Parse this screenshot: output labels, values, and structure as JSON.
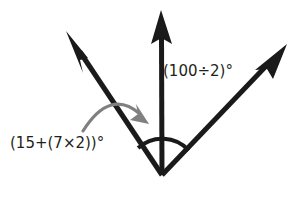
{
  "diagram": {
    "type": "angle-diagram",
    "background_color": "#ffffff",
    "ray_color": "#1a1a1a",
    "arc_color": "#1a1a1a",
    "curved_arrow_color": "#808080",
    "text_color": "#231f20",
    "vertex": {
      "x": 162,
      "y": 175,
      "name": "common-vertex"
    },
    "rays": [
      {
        "name": "left-ray",
        "from": {
          "x": 162,
          "y": 175
        },
        "to": {
          "x": 66,
          "y": 31
        },
        "has_arrowhead": true,
        "stroke_width": 5
      },
      {
        "name": "vertical-ray",
        "from": {
          "x": 162,
          "y": 175
        },
        "to": {
          "x": 161,
          "y": 10
        },
        "has_arrowhead": true,
        "stroke_width": 5
      },
      {
        "name": "right-ray",
        "from": {
          "x": 162,
          "y": 175
        },
        "to": {
          "x": 287,
          "y": 44
        },
        "has_arrowhead": true,
        "stroke_width": 5
      }
    ],
    "arc": {
      "name": "angle-arc",
      "center": {
        "x": 162,
        "y": 175
      },
      "radius": 36,
      "stroke_width": 4,
      "spans_from_ray": "left-ray",
      "spans_to_ray": "right-ray"
    },
    "curved_arrow": {
      "name": "rotation-arrow",
      "start": {
        "x": 83,
        "y": 131
      },
      "end": {
        "x": 147,
        "y": 123
      },
      "control": {
        "x": 112,
        "y": 91
      },
      "stroke_width": 3,
      "direction": "clockwise"
    },
    "labels": [
      {
        "name": "left-angle-label",
        "text": "(15+(7×2))°",
        "expression": "(15+(7×2))",
        "value_degrees": 29,
        "position": {
          "x": 10,
          "y": 136
        },
        "describes_ray_pair": [
          "left-ray",
          "vertical-ray"
        ]
      },
      {
        "name": "right-angle-label",
        "text": "(100÷2)°",
        "expression": "(100÷2)",
        "value_degrees": 50,
        "position": {
          "x": 163,
          "y": 64
        },
        "describes_ray_pair": [
          "vertical-ray",
          "right-ray"
        ]
      }
    ]
  }
}
